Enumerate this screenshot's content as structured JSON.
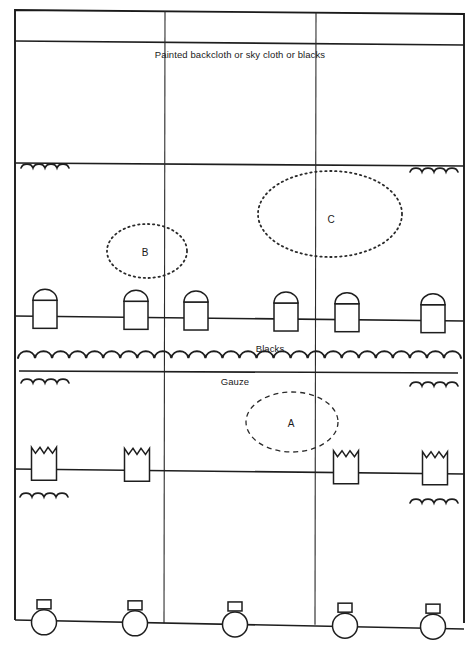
{
  "diagram": {
    "labels": {
      "backcloth": "Painted backcloth or sky cloth or blacks",
      "blacks": "Blacks",
      "gauze": "Gauze"
    },
    "areas": [
      {
        "id": "A",
        "label": "A",
        "style": "dashed",
        "cx": 292,
        "cy": 422,
        "rx": 46,
        "ry": 30
      },
      {
        "id": "B",
        "label": "B",
        "style": "dotted",
        "cx": 147,
        "cy": 251,
        "rx": 40,
        "ry": 27
      },
      {
        "id": "C",
        "label": "C",
        "style": "dotted",
        "cx": 330,
        "cy": 214,
        "rx": 72,
        "ry": 43
      }
    ],
    "frame": {
      "outer": {
        "x1": 15,
        "y1": 10,
        "x2": 464,
        "y2": 14
      },
      "column_dividers_x": [
        165,
        316
      ],
      "rows_y": {
        "pelmet": 41,
        "backcloth_bottom": 163
      }
    },
    "bars": [
      {
        "name": "spot-bar-1",
        "type": "spotlight",
        "y": 316,
        "units_x": [
          45,
          136,
          196,
          286,
          347,
          433
        ]
      },
      {
        "name": "flood-bar-2",
        "type": "floodlight",
        "y": 469,
        "units_x": [
          44,
          137,
          346,
          435
        ]
      },
      {
        "name": "footlights",
        "type": "footlight",
        "y": 622,
        "units_x": [
          44,
          135,
          235,
          345,
          433
        ]
      }
    ],
    "drapes": {
      "blacks_wave_y": 358,
      "gauze_line_y": 371,
      "masking_waves": [
        {
          "x": 21,
          "y": 168
        },
        {
          "x": 410,
          "y": 172
        },
        {
          "x": 21,
          "y": 383
        },
        {
          "x": 410,
          "y": 386
        },
        {
          "x": 20,
          "y": 497
        },
        {
          "x": 410,
          "y": 503
        }
      ]
    }
  }
}
